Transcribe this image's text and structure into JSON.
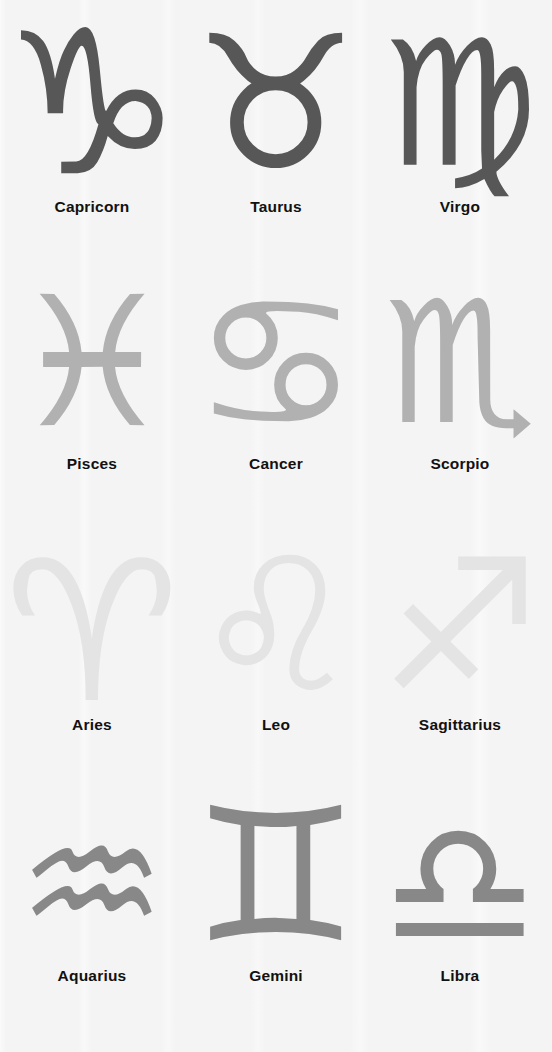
{
  "poster": {
    "title": "Zodiac Signs Chart",
    "background_color": "#f4f4f4",
    "columns": 3,
    "rows": 4
  },
  "rows": [
    {
      "index": 1,
      "tone_name": "dark-gray",
      "color": "#575757",
      "signs": [
        {
          "name": "Capricorn",
          "glyph": "♑",
          "element": "Earth"
        },
        {
          "name": "Taurus",
          "glyph": "♉",
          "element": "Earth"
        },
        {
          "name": "Virgo",
          "glyph": "♍",
          "element": "Earth"
        }
      ]
    },
    {
      "index": 2,
      "tone_name": "light-gray",
      "color": "#b1b1b1",
      "signs": [
        {
          "name": "Pisces",
          "glyph": "♓",
          "element": "Water"
        },
        {
          "name": "Cancer",
          "glyph": "♋",
          "element": "Water"
        },
        {
          "name": "Scorpio",
          "glyph": "♏",
          "element": "Water"
        }
      ]
    },
    {
      "index": 3,
      "tone_name": "pale-gray",
      "color": "#e4e4e4",
      "signs": [
        {
          "name": "Aries",
          "glyph": "♈",
          "element": "Fire"
        },
        {
          "name": "Leo",
          "glyph": "♌",
          "element": "Fire"
        },
        {
          "name": "Sagittarius",
          "glyph": "♐",
          "element": "Fire"
        }
      ]
    },
    {
      "index": 4,
      "tone_name": "mid-gray",
      "color": "#888888",
      "signs": [
        {
          "name": "Aquarius",
          "glyph": "♒",
          "element": "Air"
        },
        {
          "name": "Gemini",
          "glyph": "♊",
          "element": "Air"
        },
        {
          "name": "Libra",
          "glyph": "♎",
          "element": "Air"
        }
      ]
    }
  ]
}
